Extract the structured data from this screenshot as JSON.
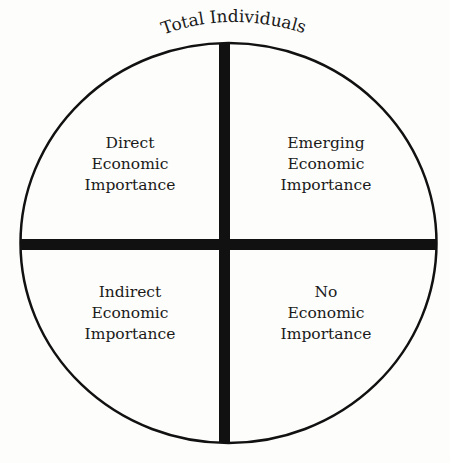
{
  "diagram": {
    "title": "Total Individuals",
    "quadrants": [
      {
        "position": "top-left",
        "lines": [
          "Direct",
          "Economic",
          "Importance"
        ]
      },
      {
        "position": "top-right",
        "lines": [
          "Emerging",
          "Economic",
          "Importance"
        ]
      },
      {
        "position": "bottom-left",
        "lines": [
          "Indirect",
          "Economic",
          "Importance"
        ]
      },
      {
        "position": "bottom-right",
        "lines": [
          "No",
          "Economic",
          "Importance"
        ]
      }
    ],
    "colors": {
      "stroke": "#111111",
      "background": "#fdfdfb"
    }
  }
}
